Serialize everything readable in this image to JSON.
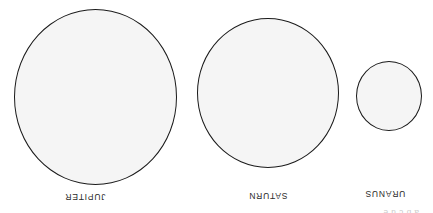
{
  "figure": {
    "orientation": "upside-down",
    "background_color": "#ffffff",
    "outline_color": "#1a1a1a",
    "fill_color": "#f5f5f5",
    "clipped_top_text": "a  b  c        d      e"
  },
  "planets": [
    {
      "id": "uranus",
      "label": "URANUS",
      "diameter_px": 66,
      "center_x_px": 44,
      "center_y_px": 117
    },
    {
      "id": "saturn",
      "label": "SATURN",
      "diameter_px": 145,
      "center_x_px": 165,
      "center_y_px": 120
    },
    {
      "id": "jupiter",
      "label": "JUPITER",
      "diameter_px": 168,
      "center_x_px": 338,
      "center_y_px": 116
    }
  ]
}
